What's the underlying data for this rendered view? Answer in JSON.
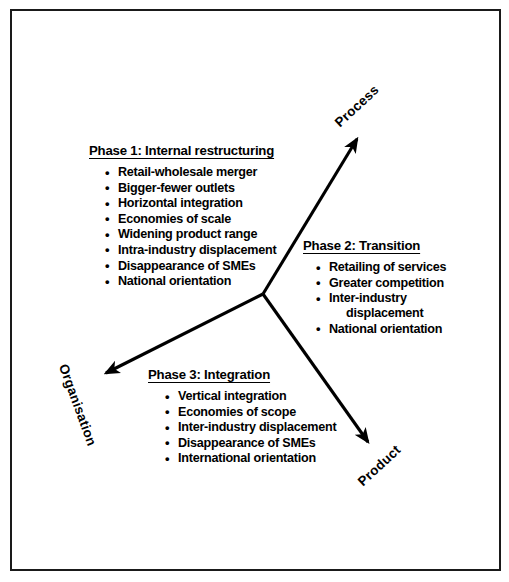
{
  "figure": {
    "shape": "circle",
    "axes": [
      {
        "name": "process",
        "label": "Process"
      },
      {
        "name": "product",
        "label": "Product"
      },
      {
        "name": "organisation",
        "label": "Organisation"
      }
    ],
    "colors": {
      "ink": "#000000",
      "border": "#1a1a1a",
      "background": "#ffffff"
    }
  },
  "phases": [
    {
      "id": "phase1",
      "title": "Phase 1: Internal restructuring",
      "items": [
        "Retail-wholesale merger",
        "Bigger-fewer outlets",
        "Horizontal integration",
        "Economies of scale",
        "Widening product range",
        "Intra-industry displacement",
        "Disappearance of SMEs",
        "National orientation"
      ]
    },
    {
      "id": "phase2",
      "title": "Phase 2: Transition",
      "items": [
        "Retailing of services",
        "Greater competition",
        "Inter-industry",
        "displacement",
        "National orientation"
      ]
    },
    {
      "id": "phase3",
      "title": "Phase 3: Integration",
      "items": [
        "Vertical integration",
        "Economies of scope",
        "Inter-industry displacement",
        "Disappearance of SMEs",
        "International orientation"
      ]
    }
  ]
}
